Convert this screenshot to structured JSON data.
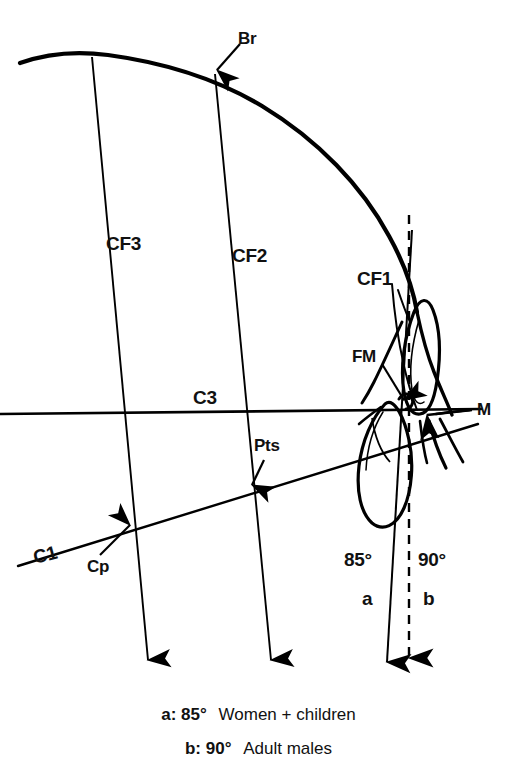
{
  "figure": {
    "type": "anatomical-diagram",
    "background_color": "#ffffff",
    "line_color": "#000000"
  },
  "landmarks": [
    {
      "id": "Br",
      "label": "Br",
      "meaning": "bregma"
    },
    {
      "id": "Pts",
      "label": "Pts",
      "meaning": "pterion-superior"
    },
    {
      "id": "Cp",
      "label": "Cp",
      "meaning": "condylion posterior"
    },
    {
      "id": "FM",
      "label": "FM",
      "meaning": "foramen magnum"
    },
    {
      "id": "M",
      "label": "M",
      "meaning": "mastoid"
    }
  ],
  "reference_lines": [
    {
      "id": "CF1",
      "label": "CF1",
      "kind": "vertical-craniofacial"
    },
    {
      "id": "CF2",
      "label": "CF2",
      "kind": "vertical-craniofacial"
    },
    {
      "id": "CF3",
      "label": "CF3",
      "kind": "vertical-craniofacial"
    },
    {
      "id": "C1",
      "label": "C1",
      "kind": "oblique-horizontal"
    },
    {
      "id": "C3",
      "label": "C3",
      "kind": "horizontal"
    }
  ],
  "angles": [
    {
      "id": "a",
      "marker": "a",
      "value": "85°"
    },
    {
      "id": "b",
      "marker": "b",
      "value": "90°"
    }
  ],
  "labels": {
    "br": "Br",
    "cf3": "CF3",
    "cf2": "CF2",
    "cf1": "CF1",
    "fm": "FM",
    "c3": "C3",
    "m": "M",
    "pts": "Pts",
    "c1": "C1",
    "cp": "Cp",
    "angle_85": "85°",
    "angle_90": "90°",
    "marker_a": "a",
    "marker_b": "b"
  },
  "caption": {
    "line1": {
      "key": "a:",
      "degrees": "85°",
      "description": "Women + children"
    },
    "line2": {
      "key": "b:",
      "degrees": "90°",
      "description": "Adult males"
    }
  }
}
